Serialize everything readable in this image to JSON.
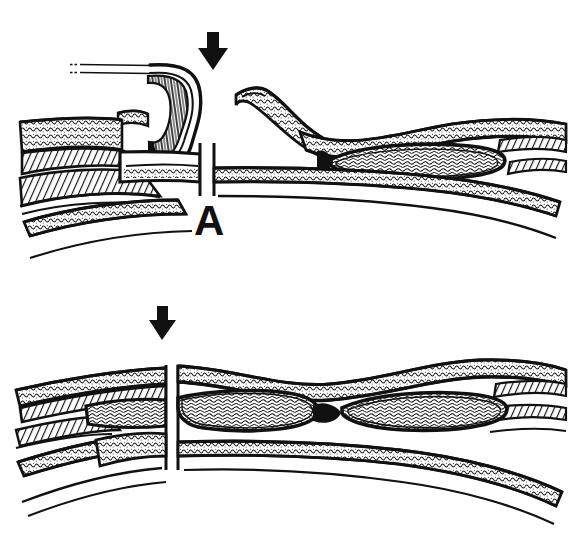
{
  "figure": {
    "title": "Two-panel anatomical line drawing",
    "style": "black-and-white pen-and-ink stipple/hatch medical illustration",
    "background_color": "#ffffff",
    "ink_color": "#111111",
    "width": 577,
    "height": 537
  },
  "panels": [
    {
      "id": "A",
      "label": "A",
      "label_position": {
        "x": 194,
        "y": 200
      },
      "marker": {
        "name": "down-arrow",
        "glyph": "↓",
        "position": {
          "x": 213,
          "y": 52
        },
        "direction": "down",
        "color": "#111111"
      },
      "caption": "Curved tubular duct with hooked tip approached by a thin probe entering from upper left; tissue layers are interrupted by a vertical cleft beneath the arrow; a lens-shaped structure lies to the right.",
      "elements": [
        "thin-probe-two-parallel-lines",
        "hooked-curved-duct",
        "upper-tissue-layer-stippled",
        "lower-tissue-layer-stippled",
        "hatched-muscle-band",
        "vertical-cleft-gap",
        "lens-shaped-body-right"
      ]
    },
    {
      "id": "B",
      "label": "B",
      "label_position": {
        "x": 154,
        "y": 462
      },
      "marker": {
        "name": "down-arrow",
        "glyph": "↓",
        "position": {
          "x": 162,
          "y": 322
        },
        "direction": "down",
        "color": "#111111"
      },
      "caption": "Two adjacent lens-shaped bodies separated by a narrow isthmus, with a vertical cleft through the tissue layers beneath the arrow.",
      "elements": [
        "upper-tissue-layer-stippled",
        "lower-tissue-layer-stippled",
        "hatched-muscle-band",
        "vertical-cleft-gap",
        "lens-shaped-body-left",
        "lens-shaped-body-right",
        "narrow-isthmus"
      ]
    }
  ]
}
